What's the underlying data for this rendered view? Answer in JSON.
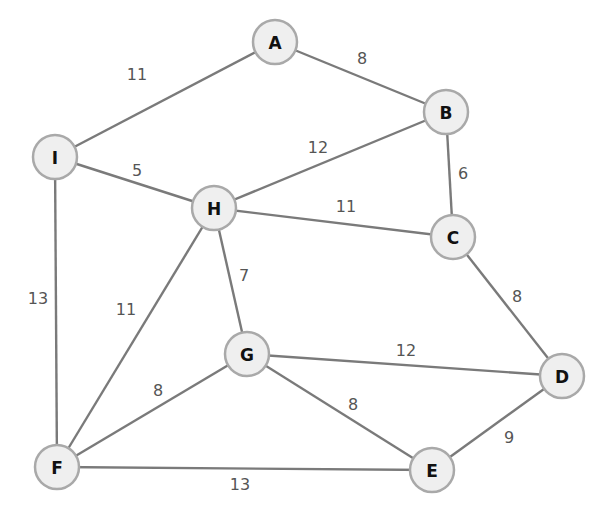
{
  "diagram": {
    "type": "weighted-undirected-graph",
    "node_radius": 22,
    "colors": {
      "node_fill": "#efefef",
      "node_stroke": "#a9a9a9",
      "edge": "#7a7a7a",
      "label": "#111111",
      "weight": "#555555"
    },
    "nodes": [
      {
        "id": "A",
        "label": "A",
        "x": 275,
        "y": 42
      },
      {
        "id": "B",
        "label": "B",
        "x": 446,
        "y": 112
      },
      {
        "id": "I",
        "label": "I",
        "x": 55,
        "y": 157
      },
      {
        "id": "H",
        "label": "H",
        "x": 214,
        "y": 208
      },
      {
        "id": "C",
        "label": "C",
        "x": 453,
        "y": 237
      },
      {
        "id": "G",
        "label": "G",
        "x": 247,
        "y": 354
      },
      {
        "id": "D",
        "label": "D",
        "x": 562,
        "y": 376
      },
      {
        "id": "F",
        "label": "F",
        "x": 57,
        "y": 467
      },
      {
        "id": "E",
        "label": "E",
        "x": 432,
        "y": 470
      }
    ],
    "edges": [
      {
        "from": "A",
        "to": "B",
        "weight": "8",
        "lx": 362,
        "ly": 58
      },
      {
        "from": "A",
        "to": "I",
        "weight": "11",
        "lx": 137,
        "ly": 74
      },
      {
        "from": "B",
        "to": "C",
        "weight": "6",
        "lx": 463,
        "ly": 173
      },
      {
        "from": "B",
        "to": "H",
        "weight": "12",
        "lx": 318,
        "ly": 147
      },
      {
        "from": "I",
        "to": "H",
        "weight": "5",
        "lx": 137,
        "ly": 170
      },
      {
        "from": "I",
        "to": "F",
        "weight": "13",
        "lx": 38,
        "ly": 298
      },
      {
        "from": "H",
        "to": "C",
        "weight": "11",
        "lx": 346,
        "ly": 206
      },
      {
        "from": "H",
        "to": "G",
        "weight": "7",
        "lx": 244,
        "ly": 275
      },
      {
        "from": "H",
        "to": "F",
        "weight": "11",
        "lx": 126,
        "ly": 309
      },
      {
        "from": "C",
        "to": "D",
        "weight": "8",
        "lx": 517,
        "ly": 296
      },
      {
        "from": "G",
        "to": "D",
        "weight": "12",
        "lx": 406,
        "ly": 350
      },
      {
        "from": "G",
        "to": "F",
        "weight": "8",
        "lx": 158,
        "ly": 390
      },
      {
        "from": "G",
        "to": "E",
        "weight": "8",
        "lx": 353,
        "ly": 404
      },
      {
        "from": "F",
        "to": "E",
        "weight": "13",
        "lx": 240,
        "ly": 484
      },
      {
        "from": "E",
        "to": "D",
        "weight": "9",
        "lx": 509,
        "ly": 437
      }
    ]
  }
}
